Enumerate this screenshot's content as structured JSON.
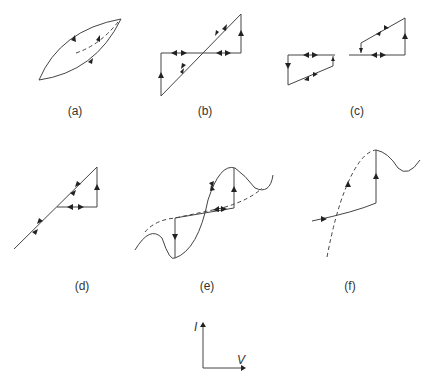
{
  "figure": {
    "panels": [
      {
        "id": "a",
        "label": "(a)",
        "description": "Lens-shaped hysteresis loop with dashed inner trace"
      },
      {
        "id": "b",
        "label": "(b)",
        "description": "Z-shaped loop with diagonal line and vertical jumps"
      },
      {
        "id": "c",
        "label": "(c)",
        "description": "Split loops with horizontal segments and vertical jumps"
      },
      {
        "id": "d",
        "label": "(d)",
        "description": "Diagonal line with triangular excursion"
      },
      {
        "id": "e",
        "label": "(e)",
        "description": "S-shaped curve with dashed unstable branch and vertical jumps"
      },
      {
        "id": "f",
        "label": "(f)",
        "description": "Curve with dashed branch and vertical jump to peak"
      }
    ],
    "axes": {
      "y_label": "I",
      "x_label": "V"
    }
  }
}
